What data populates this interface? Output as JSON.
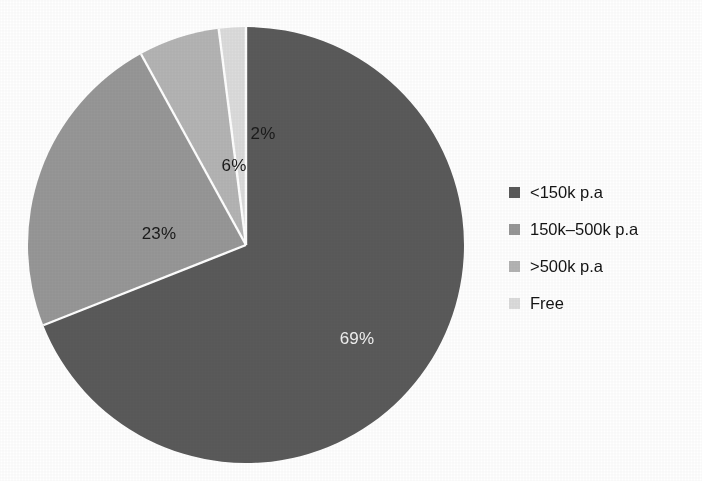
{
  "chart_data": {
    "type": "pie",
    "title": "",
    "subtitle": "",
    "xlabel": "",
    "ylabel": "",
    "grid": false,
    "legend_position": "right",
    "start_angle_deg": 0,
    "direction": "clockwise",
    "categories": [
      "<150k p.a",
      "150k–500k p.a",
      ">500k p.a",
      "Free"
    ],
    "values": [
      69,
      23,
      6,
      2
    ],
    "value_unit": "%",
    "data_labels": [
      "69%",
      "23%",
      "6%",
      "2%"
    ],
    "colors": [
      "#5a5a5a",
      "#979797",
      "#b4b4b4",
      "#dcdcdc"
    ],
    "slices": [
      {
        "label": "<150k p.a",
        "value": 69,
        "data_label": "69%",
        "color": "#5a5a5a",
        "label_color": "light",
        "label_x": 330,
        "label_y": 318
      },
      {
        "label": "150k–500k p.a",
        "value": 23,
        "data_label": "23%",
        "color": "#979797",
        "label_color": "dark",
        "label_x": 132,
        "label_y": 213
      },
      {
        "label": ">500k p.a",
        "value": 6,
        "data_label": "6%",
        "color": "#b4b4b4",
        "label_color": "dark",
        "label_x": 207,
        "label_y": 145
      },
      {
        "label": "Free",
        "value": 2,
        "data_label": "2%",
        "color": "#dcdcdc",
        "label_color": "dark",
        "label_x": 236,
        "label_y": 113
      }
    ]
  },
  "pie": {
    "labels": {
      "slice1": "69%",
      "slice2": "23%",
      "slice3": "6%",
      "slice4": "2%"
    }
  },
  "legend": {
    "items": [
      {
        "label": "<150k p.a",
        "color": "#5a5a5a"
      },
      {
        "label": "150k–500k p.a",
        "color": "#979797"
      },
      {
        "label": ">500k p.a",
        "color": "#b4b4b4"
      },
      {
        "label": "Free",
        "color": "#dcdcdc"
      }
    ]
  },
  "colors": {
    "background": "#ffffff",
    "text": "#141414",
    "label_light": "#f2f2f2",
    "slice_separator": "#ffffff"
  }
}
